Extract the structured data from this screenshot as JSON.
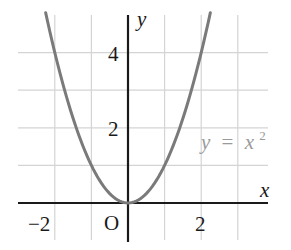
{
  "chart_data": {
    "type": "line",
    "title": "",
    "xlabel": "x",
    "ylabel": "y",
    "origin_label": "O",
    "xlim": [
      -2.5,
      4.2
    ],
    "ylim": [
      -0.7,
      5.1
    ],
    "grid": true,
    "grid_step": 1,
    "x_ticks": [
      {
        "value": -2,
        "label": "−2"
      },
      {
        "value": 2,
        "label": "2"
      }
    ],
    "y_ticks": [
      {
        "value": 2,
        "label": "2"
      },
      {
        "value": 4,
        "label": "4"
      }
    ],
    "series": [
      {
        "name": "y = x²",
        "function": "x^2",
        "color": "#7a7a7a",
        "x_range": [
          -2.25,
          2.25
        ],
        "x": [
          -2.25,
          -2,
          -1.5,
          -1,
          -0.5,
          0,
          0.5,
          1,
          1.5,
          2,
          2.25
        ],
        "values": [
          5.06,
          4,
          2.25,
          1,
          0.25,
          0,
          0.25,
          1,
          2.25,
          4,
          5.06
        ]
      }
    ],
    "annotations": [
      {
        "text": "y = x²",
        "x": 3.0,
        "y": 1.7,
        "color": "#9a9a9a"
      }
    ],
    "legend": "none"
  },
  "labels": {
    "x_axis": "x",
    "y_axis": "y",
    "origin": "O",
    "tick_x_neg2": "−2",
    "tick_x_2": "2",
    "tick_y_2": "2",
    "tick_y_4": "4",
    "eq_y": "y",
    "eq_equals": "=",
    "eq_x": "x",
    "eq_exp": "2"
  }
}
